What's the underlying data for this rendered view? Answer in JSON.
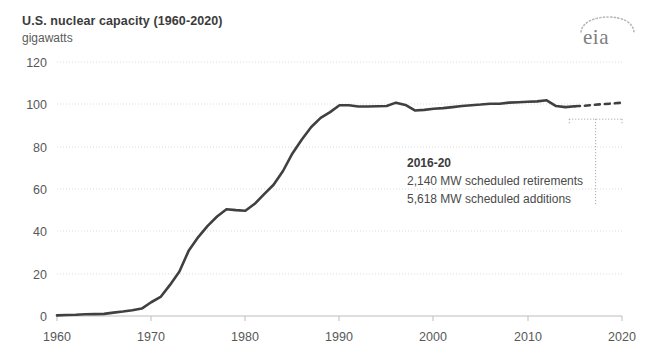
{
  "header": {
    "title": "U.S. nuclear capacity (1960-2020)",
    "subtitle": "gigawatts",
    "logo_text": "eia",
    "logo_name": "eia-logo"
  },
  "annotation": {
    "heading": "2016-20",
    "line1": "2,140 MW scheduled retirements",
    "line2": "5,618 MW scheduled additions"
  },
  "colors": {
    "line": "#404040",
    "grid": "#d9d9d9",
    "axis": "#bdbdbd",
    "text": "#4a4a4a",
    "title": "#3b3b3b",
    "logo": "#808080",
    "background": "#ffffff"
  },
  "chart_data": {
    "type": "line",
    "title": "U.S. nuclear capacity (1960-2020)",
    "subtitle": "gigawatts",
    "xlabel": "",
    "ylabel": "gigawatts",
    "xlim": [
      1960,
      2020
    ],
    "ylim": [
      0,
      120
    ],
    "xticks": [
      1960,
      1970,
      1980,
      1990,
      2000,
      2010,
      2020
    ],
    "yticks": [
      0,
      20,
      40,
      60,
      80,
      100,
      120
    ],
    "grid": true,
    "legend": false,
    "series": [
      {
        "name": "Nuclear capacity (historical)",
        "style": "solid",
        "x": [
          1960,
          1961,
          1962,
          1963,
          1964,
          1965,
          1966,
          1967,
          1968,
          1969,
          1970,
          1971,
          1972,
          1973,
          1974,
          1975,
          1976,
          1977,
          1978,
          1979,
          1980,
          1981,
          1982,
          1983,
          1984,
          1985,
          1986,
          1987,
          1988,
          1989,
          1990,
          1991,
          1992,
          1993,
          1994,
          1995,
          1996,
          1997,
          1998,
          1999,
          2000,
          2001,
          2002,
          2003,
          2004,
          2005,
          2006,
          2007,
          2008,
          2009,
          2010,
          2011,
          2012,
          2013,
          2014,
          2015
        ],
        "y": [
          0.3,
          0.5,
          0.6,
          0.8,
          0.9,
          1.0,
          1.6,
          2.1,
          2.7,
          3.5,
          6.5,
          9.0,
          14.7,
          21.0,
          31.0,
          37.3,
          42.6,
          47.0,
          50.4,
          50.0,
          49.7,
          53.0,
          57.6,
          62.0,
          68.5,
          76.8,
          83.4,
          89.3,
          93.6,
          96.3,
          99.6,
          99.6,
          99.0,
          99.0,
          99.1,
          99.2,
          100.8,
          99.7,
          97.1,
          97.4,
          97.9,
          98.2,
          98.7,
          99.2,
          99.6,
          99.9,
          100.3,
          100.3,
          100.8,
          101.0,
          101.2,
          101.4,
          101.9,
          99.2,
          98.7,
          99.1
        ],
        "color": "#404040"
      },
      {
        "name": "Nuclear capacity (projected)",
        "style": "dashed",
        "x": [
          2015,
          2016,
          2017,
          2018,
          2019,
          2020
        ],
        "y": [
          99.1,
          99.3,
          99.8,
          100.1,
          100.4,
          100.8
        ],
        "color": "#404040"
      }
    ],
    "annotations": [
      {
        "heading": "2016-20",
        "lines": [
          "2,140 MW scheduled retirements",
          "5,618 MW scheduled additions"
        ],
        "bracket_x_range": [
          2014.4,
          2020.0
        ],
        "bracket_y": 93
      }
    ]
  }
}
